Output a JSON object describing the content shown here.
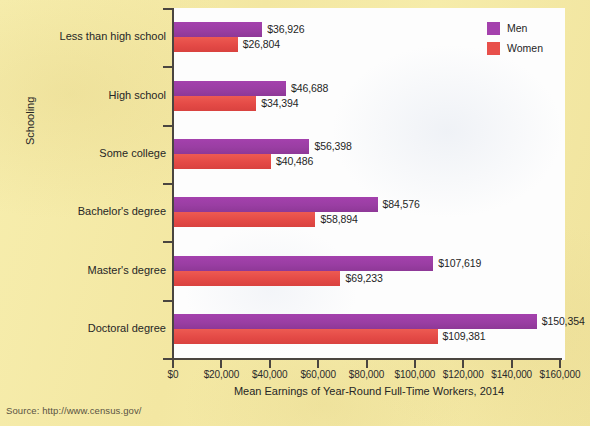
{
  "source_note": "Source: http://www.census.gov/",
  "colors": {
    "men": "#a441ad",
    "women": "#e8504b",
    "page_background": "#f6eca9",
    "plot_background": "#fdfdfd",
    "axis": "#4a4540"
  },
  "legend": {
    "position": "top-right",
    "items": [
      {
        "label": "Men",
        "color": "#a441ad"
      },
      {
        "label": "Women",
        "color": "#e8504b"
      }
    ]
  },
  "chart_data": {
    "type": "bar",
    "orientation": "horizontal",
    "title": "",
    "xlabel": "Mean Earnings of Year-Round Full-Time Workers, 2014",
    "ylabel": "Schooling",
    "xlim": [
      0,
      160000
    ],
    "grid": false,
    "xticks": [
      0,
      20000,
      40000,
      60000,
      80000,
      100000,
      120000,
      140000,
      160000
    ],
    "xtick_labels": [
      "$0",
      "$20,000",
      "$40,000",
      "$60,000",
      "$80,000",
      "$100,000",
      "$120,000",
      "$140,000",
      "$160,000"
    ],
    "categories": [
      "Less than high school",
      "High school",
      "Some college",
      "Bachelor's degree",
      "Master's degree",
      "Doctoral degree"
    ],
    "series": [
      {
        "name": "Men",
        "color": "#a441ad",
        "values": [
          36926,
          46688,
          56398,
          84576,
          107619,
          150354
        ],
        "value_labels": [
          "$36,926",
          "$46,688",
          "$56,398",
          "$84,576",
          "$107,619",
          "$150,354"
        ]
      },
      {
        "name": "Women",
        "color": "#e8504b",
        "values": [
          26804,
          34394,
          40486,
          58894,
          69233,
          109381
        ],
        "value_labels": [
          "$26,804",
          "$34,394",
          "$40,486",
          "$58,894",
          "$69,233",
          "$109,381"
        ]
      }
    ]
  }
}
